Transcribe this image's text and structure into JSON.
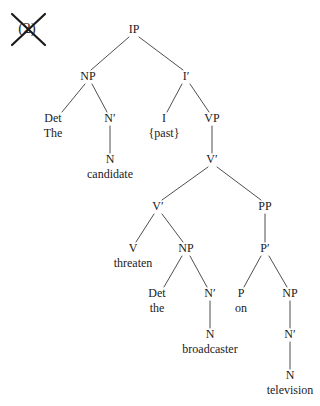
{
  "figure": {
    "example_marker": {
      "label": "(2)",
      "struck_out": true
    },
    "sentence": "The candidate {past} threaten the broadcaster on television",
    "ink_color": "#1a1a1a",
    "line_color": "#3a3a3a"
  },
  "nodes": {
    "ip": {
      "label": "IP",
      "x": 134,
      "y": 33
    },
    "np_subj": {
      "label": "NP",
      "x": 88,
      "y": 80
    },
    "ibar": {
      "label": "I′",
      "x": 186,
      "y": 80
    },
    "det1": {
      "label": "Det",
      "x": 53,
      "y": 122
    },
    "nbar1": {
      "label": "N′",
      "x": 110,
      "y": 122
    },
    "i": {
      "label": "I",
      "x": 164,
      "y": 122
    },
    "vp": {
      "label": "VP",
      "x": 212,
      "y": 122
    },
    "n1": {
      "label": "N",
      "x": 110,
      "y": 163
    },
    "vbar_top": {
      "label": "V′",
      "x": 212,
      "y": 163
    },
    "vbar_low": {
      "label": "V′",
      "x": 158,
      "y": 210
    },
    "pp": {
      "label": "PP",
      "x": 265,
      "y": 210
    },
    "v": {
      "label": "V",
      "x": 133,
      "y": 252
    },
    "np_obj": {
      "label": "NP",
      "x": 186,
      "y": 252
    },
    "pbar": {
      "label": "P′",
      "x": 265,
      "y": 252
    },
    "det2": {
      "label": "Det",
      "x": 157,
      "y": 297
    },
    "nbar2": {
      "label": "N′",
      "x": 210,
      "y": 297
    },
    "p": {
      "label": "P",
      "x": 241,
      "y": 297
    },
    "np_pp": {
      "label": "NP",
      "x": 290,
      "y": 297
    },
    "n2": {
      "label": "N",
      "x": 210,
      "y": 338
    },
    "nbar3": {
      "label": "N′",
      "x": 290,
      "y": 338
    },
    "n3": {
      "label": "N",
      "x": 290,
      "y": 379
    }
  },
  "terminals": {
    "the_subj": {
      "label": "The",
      "x": 53,
      "y": 137
    },
    "past": {
      "label": "{past}",
      "x": 164,
      "y": 137
    },
    "candidate": {
      "label": "candidate",
      "x": 110,
      "y": 178
    },
    "threaten": {
      "label": "threaten",
      "x": 133,
      "y": 267
    },
    "the_obj": {
      "label": "the",
      "x": 157,
      "y": 312
    },
    "on": {
      "label": "on",
      "x": 241,
      "y": 312
    },
    "broadcaster": {
      "label": "broadcaster",
      "x": 210,
      "y": 353
    },
    "television": {
      "label": "television",
      "x": 290,
      "y": 394
    }
  },
  "edges": [
    {
      "from": "ip",
      "to": "np_subj",
      "x1": 129,
      "y1": 37,
      "x2": 91,
      "y2": 70
    },
    {
      "from": "ip",
      "to": "ibar",
      "x1": 139,
      "y1": 37,
      "x2": 183,
      "y2": 70
    },
    {
      "from": "np_subj",
      "to": "det1",
      "x1": 85,
      "y1": 84,
      "x2": 62,
      "y2": 112
    },
    {
      "from": "np_subj",
      "to": "nbar1",
      "x1": 92,
      "y1": 84,
      "x2": 107,
      "y2": 112
    },
    {
      "from": "ibar",
      "to": "i",
      "x1": 182,
      "y1": 84,
      "x2": 167,
      "y2": 112
    },
    {
      "from": "ibar",
      "to": "vp",
      "x1": 190,
      "y1": 84,
      "x2": 209,
      "y2": 112
    },
    {
      "from": "nbar1",
      "to": "n1",
      "x1": 110,
      "y1": 126,
      "x2": 110,
      "y2": 153
    },
    {
      "from": "vp",
      "to": "vbar_top",
      "x1": 212,
      "y1": 126,
      "x2": 212,
      "y2": 153
    },
    {
      "from": "vbar_top",
      "to": "vbar_low",
      "x1": 208,
      "y1": 167,
      "x2": 162,
      "y2": 200
    },
    {
      "from": "vbar_top",
      "to": "pp",
      "x1": 217,
      "y1": 167,
      "x2": 261,
      "y2": 200
    },
    {
      "from": "vbar_low",
      "to": "v",
      "x1": 154,
      "y1": 214,
      "x2": 136,
      "y2": 242
    },
    {
      "from": "vbar_low",
      "to": "np_obj",
      "x1": 162,
      "y1": 214,
      "x2": 183,
      "y2": 242
    },
    {
      "from": "pp",
      "to": "pbar",
      "x1": 265,
      "y1": 214,
      "x2": 265,
      "y2": 242
    },
    {
      "from": "np_obj",
      "to": "det2",
      "x1": 182,
      "y1": 256,
      "x2": 164,
      "y2": 287
    },
    {
      "from": "np_obj",
      "to": "nbar2",
      "x1": 190,
      "y1": 256,
      "x2": 207,
      "y2": 287
    },
    {
      "from": "pbar",
      "to": "p",
      "x1": 261,
      "y1": 256,
      "x2": 244,
      "y2": 287
    },
    {
      "from": "pbar",
      "to": "np_pp",
      "x1": 269,
      "y1": 256,
      "x2": 287,
      "y2": 287
    },
    {
      "from": "nbar2",
      "to": "n2",
      "x1": 210,
      "y1": 301,
      "x2": 210,
      "y2": 328
    },
    {
      "from": "np_pp",
      "to": "nbar3",
      "x1": 290,
      "y1": 301,
      "x2": 290,
      "y2": 328
    },
    {
      "from": "nbar3",
      "to": "n3",
      "x1": 290,
      "y1": 342,
      "x2": 290,
      "y2": 369
    }
  ],
  "strike": {
    "glyph_x": 27,
    "glyph_y": 33,
    "line1": {
      "x1": 12,
      "y1": 14,
      "x2": 45,
      "y2": 45
    },
    "line2": {
      "x1": 45,
      "y1": 14,
      "x2": 12,
      "y2": 45
    },
    "stroke_width": 2.2
  }
}
